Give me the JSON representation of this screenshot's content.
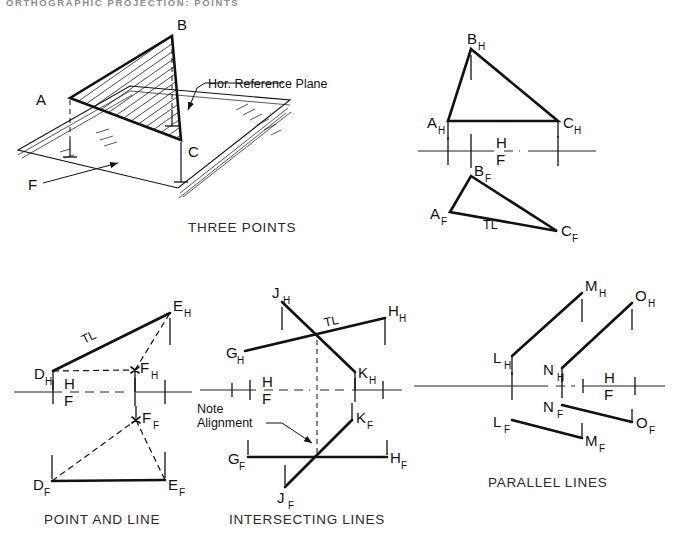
{
  "page": {
    "header": "ORTHOGRAPHIC PROJECTION: POINTS",
    "width": 683,
    "height": 545,
    "background": "#ffffff",
    "ink": "#111111",
    "header_color": "#8d8d8d"
  },
  "figures": [
    {
      "id": "pictorial-three-points",
      "caption": "THREE POINTS",
      "type": "pictorial",
      "annotations": [
        {
          "name": "plane-callout",
          "text": "Hor. Reference Plane"
        },
        {
          "name": "frontal-direction",
          "text": "F"
        }
      ],
      "points": [
        {
          "label": "A",
          "sub": ""
        },
        {
          "label": "B",
          "sub": ""
        },
        {
          "label": "C",
          "sub": ""
        }
      ]
    },
    {
      "id": "ortho-three-points",
      "caption": "",
      "type": "orthographic",
      "fold_labels": {
        "top": "H",
        "bottom": "F"
      },
      "points": [
        {
          "label": "A",
          "sub": "H"
        },
        {
          "label": "B",
          "sub": "H"
        },
        {
          "label": "C",
          "sub": "H"
        },
        {
          "label": "A",
          "sub": "F"
        },
        {
          "label": "B",
          "sub": "F"
        },
        {
          "label": "C",
          "sub": "F"
        }
      ],
      "annotations": [
        {
          "name": "true-length",
          "text": "TL"
        }
      ]
    },
    {
      "id": "point-and-line",
      "caption": "POINT AND LINE",
      "type": "orthographic",
      "fold_labels": {
        "top": "H",
        "bottom": "F"
      },
      "points": [
        {
          "label": "D",
          "sub": "H"
        },
        {
          "label": "E",
          "sub": "H"
        },
        {
          "label": "F",
          "sub": "H"
        },
        {
          "label": "D",
          "sub": "F"
        },
        {
          "label": "E",
          "sub": "F"
        },
        {
          "label": "F",
          "sub": "F"
        }
      ],
      "annotations": [
        {
          "name": "true-length",
          "text": "TL"
        }
      ]
    },
    {
      "id": "intersecting-lines",
      "caption": "INTERSECTING LINES",
      "type": "orthographic",
      "fold_labels": {
        "top": "H",
        "bottom": "F"
      },
      "points": [
        {
          "label": "G",
          "sub": "H"
        },
        {
          "label": "H",
          "sub": "H"
        },
        {
          "label": "J",
          "sub": "H"
        },
        {
          "label": "K",
          "sub": "H"
        },
        {
          "label": "G",
          "sub": "F"
        },
        {
          "label": "H",
          "sub": "F"
        },
        {
          "label": "J",
          "sub": "F"
        },
        {
          "label": "K",
          "sub": "F"
        }
      ],
      "annotations": [
        {
          "name": "true-length",
          "text": "TL"
        },
        {
          "name": "note-alignment-line1",
          "text": "Note"
        },
        {
          "name": "note-alignment-line2",
          "text": "Alignment"
        }
      ]
    },
    {
      "id": "parallel-lines",
      "caption": "PARALLEL LINES",
      "type": "orthographic",
      "fold_labels": {
        "top": "H",
        "bottom": "F"
      },
      "points": [
        {
          "label": "L",
          "sub": "H"
        },
        {
          "label": "M",
          "sub": "H"
        },
        {
          "label": "N",
          "sub": "H"
        },
        {
          "label": "O",
          "sub": "H"
        },
        {
          "label": "L",
          "sub": "F"
        },
        {
          "label": "M",
          "sub": "F"
        },
        {
          "label": "N",
          "sub": "F"
        },
        {
          "label": "O",
          "sub": "F"
        }
      ],
      "annotations": []
    }
  ],
  "labels": {
    "header": "ORTHOGRAPHIC PROJECTION: POINTS",
    "hor_reference_plane": "Hor. Reference Plane",
    "F_direction": "F",
    "A": "A",
    "B": "B",
    "C": "C",
    "H": "H",
    "Fsub": "F",
    "TL": "TL",
    "note_line1": "Note",
    "note_line2": "Alignment",
    "cap_three_points": "THREE POINTS",
    "cap_point_and_line": "POINT AND LINE",
    "cap_intersecting_lines": "INTERSECTING LINES",
    "cap_parallel_lines": "PARALLEL LINES",
    "sub_H": "H",
    "sub_F": "F",
    "pt_D": "D",
    "pt_E": "E",
    "pt_F": "F",
    "pt_G": "G",
    "pt_Hh": "H",
    "pt_J": "J",
    "pt_K": "K",
    "pt_L": "L",
    "pt_M": "M",
    "pt_N": "N",
    "pt_O": "O"
  }
}
